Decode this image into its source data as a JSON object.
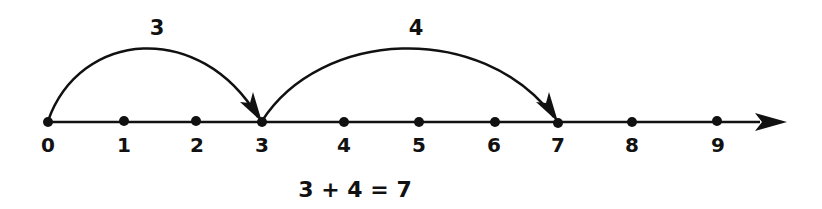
{
  "diagram": {
    "type": "number-line",
    "color": "#111111",
    "axis": {
      "y": 122,
      "x_start": 48,
      "x_end": 785
    },
    "ticks": [
      {
        "value": "0",
        "x": 48
      },
      {
        "value": "1",
        "x": 124
      },
      {
        "value": "2",
        "x": 196
      },
      {
        "value": "3",
        "x": 262
      },
      {
        "value": "4",
        "x": 344
      },
      {
        "value": "5",
        "x": 419
      },
      {
        "value": "6",
        "x": 495
      },
      {
        "value": "7",
        "x": 558
      },
      {
        "value": "8",
        "x": 632
      },
      {
        "value": "9",
        "x": 717
      }
    ],
    "jumps": [
      {
        "label": "3",
        "from": "0",
        "to": "3"
      },
      {
        "label": "4",
        "from": "3",
        "to": "7"
      }
    ],
    "equation": "3 + 4 = 7"
  }
}
